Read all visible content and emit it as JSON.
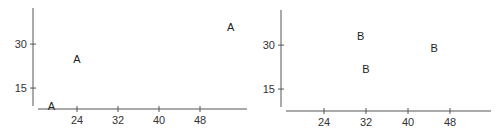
{
  "chart_data": [
    {
      "type": "scatter",
      "title": "",
      "xlabel": "",
      "ylabel": "",
      "marker": "A",
      "x_ticks": [
        24,
        32,
        40,
        48
      ],
      "y_ticks": [
        15,
        30
      ],
      "xlim": [
        16,
        56
      ],
      "ylim": [
        8,
        42
      ],
      "grid": false,
      "legend": null,
      "series": [
        {
          "name": "A",
          "points": [
            {
              "x": 19,
              "y": 9
            },
            {
              "x": 24,
              "y": 25
            },
            {
              "x": 54,
              "y": 36
            }
          ]
        }
      ]
    },
    {
      "type": "scatter",
      "title": "",
      "xlabel": "",
      "ylabel": "",
      "marker": "B",
      "x_ticks": [
        24,
        32,
        40,
        48
      ],
      "y_ticks": [
        15,
        30
      ],
      "xlim": [
        16,
        56
      ],
      "ylim": [
        8,
        42
      ],
      "grid": false,
      "legend": null,
      "series": [
        {
          "name": "B",
          "points": [
            {
              "x": 31,
              "y": 33
            },
            {
              "x": 32,
              "y": 22
            },
            {
              "x": 45,
              "y": 29
            }
          ]
        }
      ]
    }
  ]
}
